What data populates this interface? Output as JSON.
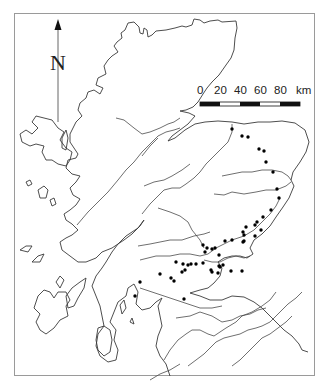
{
  "map": {
    "title": "",
    "region": "Scotland",
    "north_arrow": {
      "label": "N"
    },
    "scale_bar": {
      "ticks": [
        "0",
        "20",
        "40",
        "60",
        "80"
      ],
      "unit": "km",
      "segments": 5
    },
    "colors": {
      "frame": "#9a9a9a",
      "coast": "#3a3a3a",
      "dot": "#000000"
    },
    "dots": [
      [
        232,
        129
      ],
      [
        242,
        136
      ],
      [
        248,
        137
      ],
      [
        259,
        149
      ],
      [
        264,
        151
      ],
      [
        266,
        162
      ],
      [
        273,
        172
      ],
      [
        277,
        189
      ],
      [
        279,
        198
      ],
      [
        271,
        210
      ],
      [
        263,
        217
      ],
      [
        257,
        222
      ],
      [
        255,
        225
      ],
      [
        261,
        230
      ],
      [
        246,
        227
      ],
      [
        243,
        232
      ],
      [
        255,
        236
      ],
      [
        244,
        241
      ],
      [
        232,
        240
      ],
      [
        225,
        241
      ],
      [
        244,
        235
      ],
      [
        243,
        242
      ],
      [
        207,
        248
      ],
      [
        215,
        248
      ],
      [
        205,
        252
      ],
      [
        219,
        255
      ],
      [
        212,
        249
      ],
      [
        203,
        245
      ],
      [
        219,
        266
      ],
      [
        223,
        265
      ],
      [
        211,
        270
      ],
      [
        218,
        273
      ],
      [
        212,
        272
      ],
      [
        220,
        267
      ],
      [
        242,
        271
      ],
      [
        231,
        271
      ],
      [
        176,
        262
      ],
      [
        183,
        264
      ],
      [
        188,
        265
      ],
      [
        191,
        264
      ],
      [
        196,
        264
      ],
      [
        203,
        263
      ],
      [
        185,
        270
      ],
      [
        182,
        272
      ],
      [
        160,
        274
      ],
      [
        171,
        278
      ],
      [
        174,
        281
      ],
      [
        140,
        282
      ],
      [
        135,
        296
      ],
      [
        184,
        299
      ]
    ]
  }
}
